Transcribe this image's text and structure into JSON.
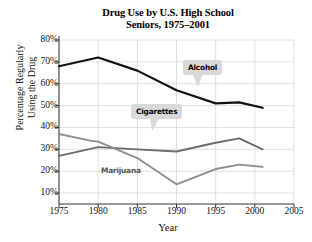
{
  "chart_data": {
    "type": "line",
    "title": "Drug Use by U.S. High School Seniors, 1975–2001",
    "title_line1": "Drug Use by U.S. High School",
    "title_line2": "Seniors, 1975–2001",
    "xlabel": "Year",
    "ylabel": "Percentage Regularly Using the Drug",
    "ylabel_line1": "Percentage Regularly",
    "ylabel_line2": "Using the Drug",
    "xlim": [
      1975,
      2005
    ],
    "ylim": [
      5,
      80
    ],
    "grid": true,
    "legend_position": "inline-callouts",
    "xticks": [
      "1975",
      "1980",
      "1985",
      "1990",
      "1995",
      "2000",
      "2005"
    ],
    "xtick_values": [
      1975,
      1980,
      1985,
      1990,
      1995,
      2000,
      2005
    ],
    "yticks": [
      "10%",
      "20%",
      "30%",
      "40%",
      "50%",
      "60%",
      "70%",
      "80%"
    ],
    "ytick_values": [
      10,
      20,
      30,
      40,
      50,
      60,
      70,
      80
    ],
    "series": [
      {
        "name": "Alcohol",
        "color": "#111111",
        "x": [
          1975,
          1980,
          1985,
          1990,
          1995,
          1998,
          2001
        ],
        "values": [
          68,
          72,
          66,
          57,
          51,
          51.5,
          49
        ]
      },
      {
        "name": "Cigarettes",
        "color": "#6b6b6b",
        "x": [
          1975,
          1980,
          1985,
          1990,
          1995,
          1998,
          2001
        ],
        "values": [
          27,
          31,
          30,
          29,
          33,
          35,
          30
        ]
      },
      {
        "name": "Marijuana",
        "color": "#8e8e8e",
        "x": [
          1975,
          1979,
          1980,
          1985,
          1990,
          1995,
          1998,
          2001
        ],
        "values": [
          37,
          34,
          33.5,
          26,
          14,
          21,
          23,
          22
        ]
      }
    ],
    "annotations": [
      {
        "text": "Alcohol",
        "style": "callout"
      },
      {
        "text": "Cigarettes",
        "style": "callout"
      },
      {
        "text": "Marijuana",
        "style": "plain"
      }
    ]
  }
}
